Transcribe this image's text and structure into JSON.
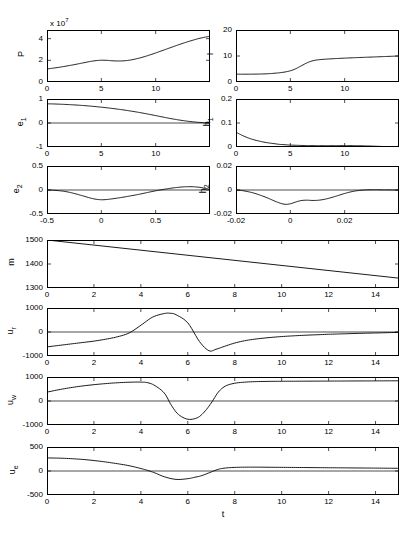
{
  "figure": {
    "xlabel": "t",
    "exponent_note": "x 10",
    "exponent_value": "7",
    "caption": ""
  },
  "chart_data": [
    {
      "id": "P",
      "type": "line",
      "title": "",
      "ylabel": "P",
      "xlabel": "",
      "xlim": [
        0,
        15
      ],
      "ylim": [
        0,
        4.8
      ],
      "xticks": [
        0,
        5,
        10
      ],
      "yticks": [
        0,
        2,
        4
      ],
      "xticklabels": [
        "0",
        "5",
        "10"
      ],
      "yticklabels": [
        "0",
        "2",
        "4"
      ],
      "y_exponent": "x 10^7",
      "grid": false,
      "legend": null,
      "x": [
        0,
        0.5,
        1,
        1.5,
        2,
        2.5,
        3,
        3.5,
        4,
        4.5,
        5,
        5.5,
        6,
        6.5,
        7,
        7.5,
        8,
        8.5,
        9,
        9.5,
        10,
        10.5,
        11,
        11.5,
        12,
        12.5,
        13,
        13.5,
        14,
        14.5,
        15
      ],
      "values": [
        1.2,
        1.27,
        1.34,
        1.42,
        1.51,
        1.6,
        1.7,
        1.8,
        1.9,
        1.97,
        2.01,
        2.0,
        1.96,
        1.94,
        1.95,
        2.0,
        2.09,
        2.21,
        2.35,
        2.51,
        2.68,
        2.86,
        3.04,
        3.22,
        3.4,
        3.57,
        3.73,
        3.88,
        4.02,
        4.13,
        4.22
      ]
    },
    {
      "id": "I",
      "type": "line",
      "title": "",
      "ylabel": "I",
      "xlabel": "",
      "xlim": [
        0,
        15
      ],
      "ylim": [
        0,
        20
      ],
      "xticks": [
        0,
        5,
        10
      ],
      "yticks": [
        0,
        10,
        20
      ],
      "xticklabels": [
        "0",
        "5",
        "10"
      ],
      "yticklabels": [
        "0",
        "10",
        "20"
      ],
      "grid": false,
      "legend": null,
      "x": [
        0,
        0.5,
        1,
        1.5,
        2,
        2.5,
        3,
        3.5,
        4,
        4.5,
        5,
        5.5,
        6,
        6.5,
        7,
        7.5,
        8,
        8.5,
        9,
        9.5,
        10,
        10.5,
        11,
        11.5,
        12,
        12.5,
        13,
        13.5,
        14,
        14.5,
        15
      ],
      "values": [
        3.0,
        3.0,
        3.0,
        3.02,
        3.05,
        3.1,
        3.2,
        3.35,
        3.55,
        3.85,
        4.3,
        5.1,
        6.2,
        7.3,
        8.1,
        8.5,
        8.7,
        8.85,
        8.97,
        9.08,
        9.18,
        9.27,
        9.36,
        9.44,
        9.52,
        9.6,
        9.68,
        9.76,
        9.84,
        9.92,
        10.0
      ]
    },
    {
      "id": "e1",
      "type": "line",
      "title": "",
      "ylabel": "e1",
      "xlabel": "",
      "xlim": [
        0,
        15
      ],
      "ylim": [
        -1,
        1
      ],
      "xticks": [
        0,
        5,
        10
      ],
      "yticks": [
        -1,
        0,
        1
      ],
      "xticklabels": [
        "0",
        "5",
        "10"
      ],
      "yticklabels": [
        "-1",
        "0",
        "1"
      ],
      "grid": false,
      "legend": null,
      "x": [
        0,
        0.5,
        1,
        1.5,
        2,
        2.5,
        3,
        3.5,
        4,
        4.5,
        5,
        5.5,
        6,
        6.5,
        7,
        7.5,
        8,
        8.5,
        9,
        9.5,
        10,
        10.5,
        11,
        11.5,
        12,
        12.5,
        13,
        13.5,
        14,
        14.5,
        15
      ],
      "values": [
        0.8,
        0.795,
        0.787,
        0.778,
        0.767,
        0.754,
        0.739,
        0.722,
        0.703,
        0.682,
        0.659,
        0.634,
        0.607,
        0.578,
        0.547,
        0.513,
        0.477,
        0.438,
        0.397,
        0.354,
        0.309,
        0.263,
        0.218,
        0.175,
        0.136,
        0.101,
        0.071,
        0.046,
        0.026,
        0.011,
        0.003
      ]
    },
    {
      "id": "h1",
      "type": "line",
      "title": "",
      "ylabel": "h1",
      "xlabel": "",
      "xlim": [
        0,
        15
      ],
      "ylim": [
        0,
        0.2
      ],
      "xticks": [
        0,
        5,
        10
      ],
      "yticks": [
        0,
        0.1,
        0.2
      ],
      "xticklabels": [
        "0",
        "5",
        "10"
      ],
      "yticklabels": [
        "0",
        "0.1",
        "0.2"
      ],
      "grid": false,
      "legend": null,
      "x": [
        0,
        0.5,
        1,
        1.5,
        2,
        2.5,
        3,
        3.5,
        4,
        4.5,
        5,
        5.5,
        6,
        6.5,
        7,
        7.5,
        8,
        8.5,
        9,
        9.5,
        10,
        10.5,
        11,
        11.5,
        12,
        12.5,
        13,
        13.5,
        14,
        14.5,
        15
      ],
      "values": [
        0.062,
        0.05,
        0.04,
        0.032,
        0.026,
        0.021,
        0.017,
        0.014,
        0.011,
        0.0095,
        0.008,
        0.0072,
        0.0065,
        0.006,
        0.0058,
        0.0056,
        0.0055,
        0.0055,
        0.0056,
        0.0057,
        0.0058,
        0.0057,
        0.0054,
        0.005,
        0.0044,
        0.0037,
        0.0029,
        0.0021,
        0.0013,
        0.0006,
        0.0002
      ]
    },
    {
      "id": "e2",
      "type": "line",
      "title": "",
      "ylabel": "e2",
      "xlabel": "",
      "xlim": [
        0,
        15
      ],
      "ylim": [
        -0.5,
        0.5
      ],
      "xticks": [
        0,
        5,
        10
      ],
      "yticks": [
        -0.5,
        0,
        0.5
      ],
      "xticklabels": [
        "-0.5",
        "0",
        "0.5"
      ],
      "yticklabels": [
        "-0.5",
        "0",
        "0.5"
      ],
      "grid": false,
      "legend": null,
      "x": [
        0,
        0.5,
        1,
        1.5,
        2,
        2.5,
        3,
        3.5,
        4,
        4.5,
        5,
        5.5,
        6,
        6.5,
        7,
        7.5,
        8,
        8.5,
        9,
        9.5,
        10,
        10.5,
        11,
        11.5,
        12,
        12.5,
        13,
        13.5,
        14,
        14.5,
        15
      ],
      "values": [
        0.0,
        -0.004,
        -0.012,
        -0.025,
        -0.045,
        -0.072,
        -0.103,
        -0.135,
        -0.168,
        -0.192,
        -0.203,
        -0.198,
        -0.184,
        -0.168,
        -0.15,
        -0.13,
        -0.11,
        -0.088,
        -0.064,
        -0.04,
        -0.017,
        0.004,
        0.023,
        0.04,
        0.054,
        0.064,
        0.069,
        0.067,
        0.057,
        0.038,
        0.012
      ]
    },
    {
      "id": "h2",
      "type": "line",
      "title": "",
      "ylabel": "h2",
      "xlabel": "",
      "xlim": [
        0,
        15
      ],
      "ylim": [
        -0.02,
        0.02
      ],
      "xticks": [
        0,
        5,
        10
      ],
      "yticks": [
        -0.02,
        0,
        0.02
      ],
      "xticklabels": [
        "-0.02",
        "0",
        "0.02"
      ],
      "yticklabels": [
        "-0.02",
        "0",
        "0.02"
      ],
      "grid": false,
      "legend": null,
      "x": [
        0,
        0.5,
        1,
        1.5,
        2,
        2.5,
        3,
        3.5,
        4,
        4.5,
        5,
        5.5,
        6,
        6.5,
        7,
        7.5,
        8,
        8.5,
        9,
        9.5,
        10,
        10.5,
        11,
        11.5,
        12,
        12.5,
        13,
        13.5,
        14,
        14.5,
        15
      ],
      "values": [
        0.0,
        -0.0004,
        -0.0012,
        -0.0022,
        -0.0036,
        -0.0052,
        -0.007,
        -0.009,
        -0.0108,
        -0.0119,
        -0.0115,
        -0.01,
        -0.0088,
        -0.0085,
        -0.0087,
        -0.0086,
        -0.008,
        -0.007,
        -0.0057,
        -0.0043,
        -0.0029,
        -0.0017,
        -0.0008,
        -0.0002,
        0.0001,
        0.0002,
        0.0002,
        0.0001,
        0.0001,
        0.0,
        0.0
      ]
    },
    {
      "id": "m",
      "type": "line",
      "title": "",
      "ylabel": "m",
      "xlabel": "",
      "xlim": [
        0,
        15
      ],
      "ylim": [
        1300,
        1500
      ],
      "xticks": [
        0,
        2,
        4,
        6,
        8,
        10,
        12,
        14
      ],
      "yticks": [
        1300,
        1400,
        1500
      ],
      "xticklabels": [
        "0",
        "2",
        "4",
        "6",
        "8",
        "10",
        "12",
        "14"
      ],
      "yticklabels": [
        "1300",
        "1400",
        "1500"
      ],
      "grid": false,
      "legend": null,
      "x": [
        0,
        15
      ],
      "values": [
        1500,
        1341
      ]
    },
    {
      "id": "ur",
      "type": "line",
      "title": "",
      "ylabel": "ur",
      "xlabel": "",
      "xlim": [
        0,
        15
      ],
      "ylim": [
        -1000,
        1000
      ],
      "xticks": [
        0,
        2,
        4,
        6,
        8,
        10,
        12,
        14
      ],
      "yticks": [
        -1000,
        0,
        1000
      ],
      "xticklabels": [
        "0",
        "2",
        "4",
        "6",
        "8",
        "10",
        "12",
        "14"
      ],
      "yticklabels": [
        "-1000",
        "0",
        "1000"
      ],
      "grid": false,
      "legend": null,
      "x": [
        0,
        0.5,
        1,
        1.5,
        2,
        2.5,
        3,
        3.5,
        4,
        4.5,
        5,
        5.25,
        5.5,
        6,
        6.5,
        6.9,
        7.2,
        7.5,
        8,
        8.5,
        9,
        9.5,
        10,
        10.5,
        11,
        11.5,
        12,
        12.5,
        13,
        13.5,
        14,
        14.5,
        15
      ],
      "values": [
        -620,
        -560,
        -500,
        -440,
        -380,
        -300,
        -200,
        -40,
        280,
        620,
        770,
        780,
        720,
        380,
        -400,
        -780,
        -720,
        -620,
        -460,
        -350,
        -280,
        -230,
        -190,
        -160,
        -135,
        -115,
        -95,
        -80,
        -65,
        -52,
        -40,
        -28,
        -15
      ]
    },
    {
      "id": "uw",
      "type": "line",
      "title": "",
      "ylabel": "uw",
      "xlabel": "",
      "xlim": [
        0,
        15
      ],
      "ylim": [
        -1000,
        1000
      ],
      "xticks": [
        0,
        2,
        4,
        6,
        8,
        10,
        12,
        14
      ],
      "yticks": [
        -1000,
        0,
        1000
      ],
      "xticklabels": [
        "0",
        "2",
        "4",
        "6",
        "8",
        "10",
        "12",
        "14"
      ],
      "yticklabels": [
        "-1000",
        "0",
        "1000"
      ],
      "grid": false,
      "legend": null,
      "x": [
        0,
        0.5,
        1,
        1.5,
        2,
        2.5,
        3,
        3.5,
        4,
        4.3,
        4.6,
        5,
        5.3,
        5.6,
        6,
        6.4,
        6.7,
        7,
        7.3,
        7.6,
        8,
        8.5,
        9,
        9.5,
        10,
        10.5,
        11,
        11.5,
        12,
        12.5,
        13,
        13.5,
        14,
        14.5,
        15
      ],
      "values": [
        370,
        470,
        555,
        625,
        680,
        725,
        760,
        782,
        788,
        760,
        640,
        330,
        -180,
        -560,
        -760,
        -700,
        -460,
        -80,
        370,
        620,
        740,
        790,
        810,
        818,
        822,
        824,
        826,
        828,
        830,
        832,
        834,
        836,
        838,
        840,
        842
      ]
    },
    {
      "id": "ue",
      "type": "line",
      "title": "",
      "ylabel": "ue",
      "xlabel": "",
      "xlim": [
        0,
        15
      ],
      "ylim": [
        -500,
        500
      ],
      "xticks": [
        0,
        2,
        4,
        6,
        8,
        10,
        12,
        14
      ],
      "yticks": [
        -500,
        0,
        500
      ],
      "xticklabels": [
        "0",
        "2",
        "4",
        "6",
        "8",
        "10",
        "12",
        "14"
      ],
      "yticklabels": [
        "-500",
        "0",
        "500"
      ],
      "grid": false,
      "legend": null,
      "x": [
        0,
        0.5,
        1,
        1.5,
        2,
        2.5,
        3,
        3.5,
        4,
        4.3,
        4.6,
        5,
        5.5,
        6,
        6.3,
        6.6,
        7,
        7.3,
        7.6,
        8,
        8.5,
        9,
        9.5,
        10,
        10.5,
        11,
        11.5,
        12,
        12.5,
        13,
        13.5,
        14,
        14.5,
        15
      ],
      "values": [
        272,
        268,
        258,
        242,
        218,
        188,
        152,
        110,
        52,
        10,
        -40,
        -120,
        -175,
        -160,
        -130,
        -95,
        -20,
        35,
        62,
        75,
        80,
        80,
        78,
        76,
        74,
        72,
        70,
        68,
        66,
        64,
        62,
        60,
        58,
        56
      ]
    }
  ]
}
